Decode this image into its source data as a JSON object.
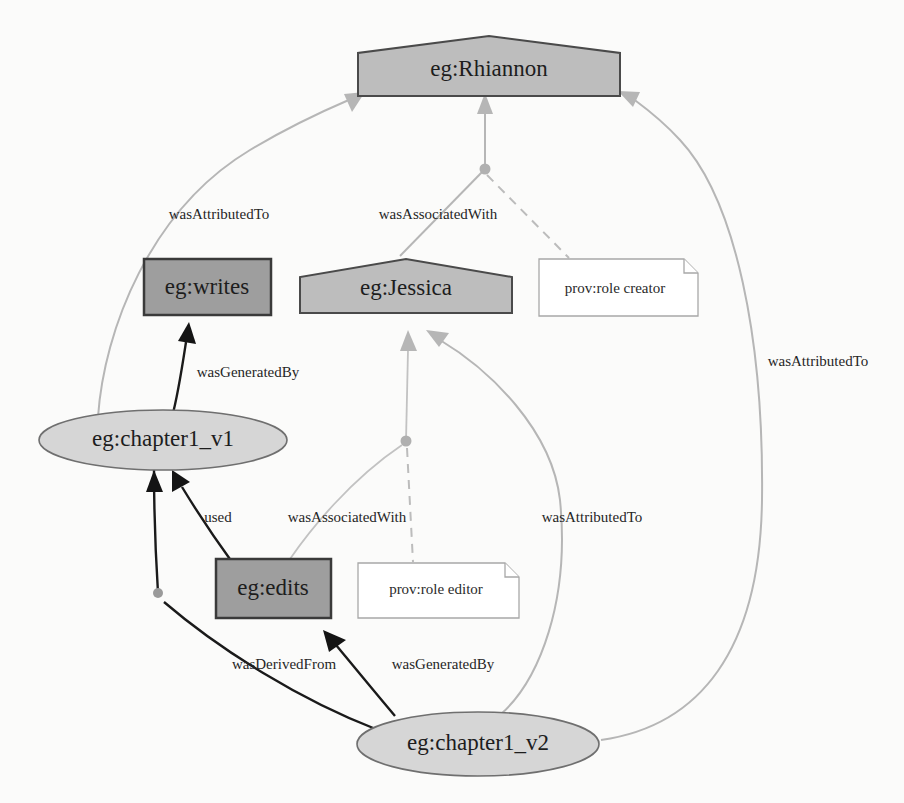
{
  "diagram": {
    "colors": {
      "agent_fill": "#bdbdbd",
      "activity_fill": "#9e9e9e",
      "entity_fill": "#d6d6d6",
      "note_fill": "#ffffff",
      "edge_gray": "#b6b6b6",
      "edge_dark": "#1a1a1a",
      "background": "#fbfbfa"
    },
    "nodes": {
      "rhiannon": {
        "label": "eg:Rhiannon",
        "type": "agent"
      },
      "jessica": {
        "label": "eg:Jessica",
        "type": "agent"
      },
      "writes": {
        "label": "eg:writes",
        "type": "activity"
      },
      "edits": {
        "label": "eg:edits",
        "type": "activity"
      },
      "chapter1_v1": {
        "label": "eg:chapter1_v1",
        "type": "entity"
      },
      "chapter1_v2": {
        "label": "eg:chapter1_v2",
        "type": "entity"
      },
      "role_creator": {
        "label": "prov:role creator",
        "type": "note"
      },
      "role_editor": {
        "label": "prov:role editor",
        "type": "note"
      }
    },
    "edges": {
      "attributed_v1_rhiannon": {
        "label": "wasAttributedTo"
      },
      "associated_writes_rhiannon": {
        "label": "wasAssociatedWith"
      },
      "attributed_v2_rhiannon": {
        "label": "wasAttributedTo"
      },
      "generated_v1_writes": {
        "label": "wasGeneratedBy"
      },
      "used_edits_v1": {
        "label": "used"
      },
      "associated_edits_jessica": {
        "label": "wasAssociatedWith"
      },
      "attributed_v2_jessica": {
        "label": "wasAttributedTo"
      },
      "derived_v2_v1": {
        "label": "wasDerivedFrom"
      },
      "generated_v2_edits": {
        "label": "wasGeneratedBy"
      }
    }
  }
}
